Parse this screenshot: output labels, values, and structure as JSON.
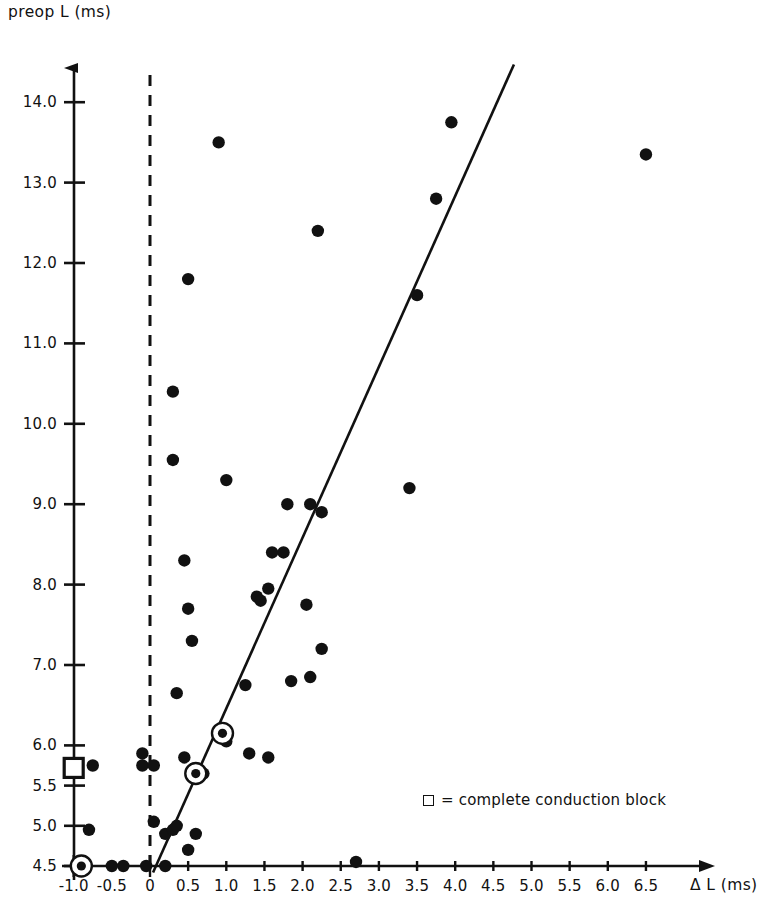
{
  "chart_data": {
    "type": "scatter",
    "title": "",
    "xlabel": "Δ L (ms)",
    "ylabel": "preop L (ms)",
    "xlim": [
      -1.15,
      6.95
    ],
    "ylim": [
      4.38,
      14.45
    ],
    "grid": false,
    "legend_position": "inside-lower-right",
    "xticks": [
      -1.0,
      -0.5,
      0,
      0.5,
      1.0,
      1.5,
      2.0,
      2.5,
      3.0,
      3.5,
      4.0,
      4.5,
      5.0,
      5.5,
      6.0,
      6.5
    ],
    "xticklabels": [
      "-1.0",
      "-0.5",
      "0",
      "0.5",
      "1.0",
      "1.5",
      "2.0",
      "2.5",
      "3.0",
      "3.5",
      "4.0",
      "4.5",
      "5.0",
      "5.5",
      "6.0",
      "6.5"
    ],
    "yticks": [
      4.5,
      5.0,
      5.5,
      6.0,
      7.0,
      8.0,
      9.0,
      10.0,
      11.0,
      12.0,
      13.0,
      14.0
    ],
    "yticklabels": [
      "4.5",
      "5.0",
      "5.5",
      "6.0",
      "7.0",
      "8.0",
      "9.0",
      "10.0",
      "11.0",
      "12.0",
      "13.0",
      "14.0"
    ],
    "series": [
      {
        "name": "patients",
        "marker": "filled-circle",
        "color": "#111111",
        "points": [
          [
            -0.75,
            5.75
          ],
          [
            -0.8,
            4.95
          ],
          [
            -0.5,
            4.5
          ],
          [
            -0.35,
            4.5
          ],
          [
            -0.05,
            4.5
          ],
          [
            0.2,
            4.5
          ],
          [
            -0.1,
            5.9
          ],
          [
            -0.1,
            5.75
          ],
          [
            0.05,
            5.75
          ],
          [
            0.05,
            5.05
          ],
          [
            0.2,
            4.9
          ],
          [
            0.3,
            4.95
          ],
          [
            0.35,
            5.0
          ],
          [
            0.5,
            4.7
          ],
          [
            0.6,
            4.9
          ],
          [
            0.45,
            5.85
          ],
          [
            0.35,
            6.65
          ],
          [
            0.6,
            5.65
          ],
          [
            0.7,
            5.65
          ],
          [
            0.95,
            6.15
          ],
          [
            1.0,
            6.05
          ],
          [
            1.3,
            5.9
          ],
          [
            1.55,
            5.85
          ],
          [
            0.55,
            7.3
          ],
          [
            0.5,
            7.7
          ],
          [
            0.45,
            8.3
          ],
          [
            0.3,
            10.4
          ],
          [
            0.3,
            9.55
          ],
          [
            0.5,
            11.8
          ],
          [
            0.9,
            13.5
          ],
          [
            1.0,
            9.3
          ],
          [
            1.25,
            6.75
          ],
          [
            1.4,
            7.85
          ],
          [
            1.45,
            7.8
          ],
          [
            1.6,
            8.4
          ],
          [
            1.55,
            7.95
          ],
          [
            1.75,
            8.4
          ],
          [
            1.8,
            9.0
          ],
          [
            1.85,
            6.8
          ],
          [
            2.1,
            6.85
          ],
          [
            2.05,
            7.75
          ],
          [
            2.1,
            9.0
          ],
          [
            2.25,
            8.9
          ],
          [
            2.25,
            7.2
          ],
          [
            2.2,
            12.4
          ],
          [
            2.7,
            4.55
          ],
          [
            3.4,
            9.2
          ],
          [
            3.5,
            11.6
          ],
          [
            3.75,
            12.8
          ],
          [
            3.95,
            13.75
          ],
          [
            6.5,
            13.35
          ]
        ]
      },
      {
        "name": "complete conduction block",
        "marker": "circled-dot",
        "color": "#111111",
        "points": [
          [
            -0.9,
            4.5
          ],
          [
            0.6,
            5.65
          ],
          [
            0.95,
            6.15
          ]
        ]
      },
      {
        "name": "block-square-on-axis",
        "marker": "open-square",
        "color": "#111111",
        "points": [
          [
            -1.0,
            5.72
          ]
        ]
      }
    ],
    "fit_line": {
      "name": "regression-line",
      "x_start": 0.04,
      "y_start": 4.42,
      "x_end": 4.77,
      "y_end": 14.47,
      "color": "#111111",
      "style": "solid"
    },
    "reference_line": {
      "name": "zero-delta-line",
      "x": 0,
      "style": "dashed",
      "color": "#111111",
      "y_start": 4.5,
      "y_end": 14.45
    }
  },
  "legend": {
    "symbol": "square",
    "text": "= complete conduction block"
  }
}
